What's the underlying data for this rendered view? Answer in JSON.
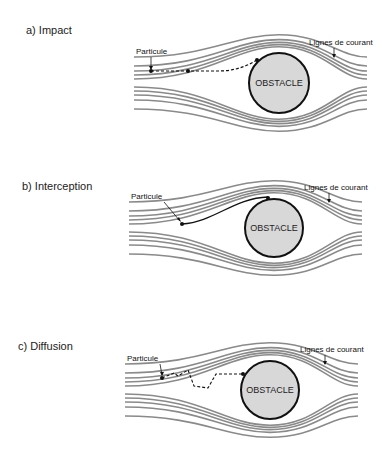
{
  "panels": [
    {
      "id": "a",
      "label": "a)  Impact",
      "label_x": 26,
      "label_y": 24,
      "cx": 279,
      "cy": 83,
      "r": 30,
      "particle_text": "Particule",
      "streamlines_text": "Lignes de courant",
      "obstacle_text": "OBSTACLE",
      "mechanism": "impact"
    },
    {
      "id": "b",
      "label": "b)  Interception",
      "label_x": 22,
      "label_y": 180,
      "cx": 274,
      "cy": 228,
      "r": 29,
      "particle_text": "Particule",
      "streamlines_text": "Lignes de courant",
      "obstacle_text": "OBSTACLE",
      "mechanism": "interception"
    },
    {
      "id": "c",
      "label": "c)  Diffusion",
      "label_x": 18,
      "label_y": 340,
      "cx": 270,
      "cy": 390,
      "r": 29,
      "particle_text": "Particule",
      "streamlines_text": "Lignes de courant",
      "obstacle_text": "OBSTACLE",
      "mechanism": "diffusion"
    }
  ],
  "colors": {
    "streamline": "#8a8a8a",
    "obstacle_fill": "#d8d8d8",
    "outline": "#111111"
  }
}
